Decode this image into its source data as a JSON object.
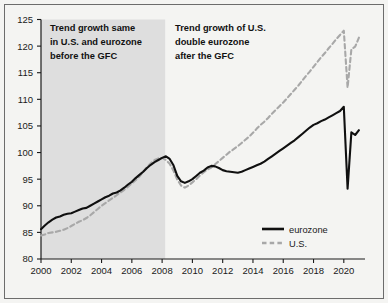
{
  "chart_data": {
    "type": "line",
    "title": "",
    "xlabel": "",
    "ylabel": "",
    "xlim": [
      2000,
      2021.4
    ],
    "ylim": [
      80,
      125
    ],
    "yticks": [
      80,
      85,
      90,
      95,
      100,
      105,
      110,
      115,
      120,
      125
    ],
    "xticks": [
      2000,
      2002,
      2004,
      2006,
      2008,
      2010,
      2012,
      2014,
      2016,
      2018,
      2020
    ],
    "grid": false,
    "legend_position": "bottom-right",
    "shaded_region": {
      "x_start": 2000,
      "x_end": 2008.2,
      "color": "#dedede",
      "label": "pre-GFC period"
    },
    "annotations": [
      {
        "id": "annotation-pre-gfc",
        "lines": [
          "Trend growth same",
          "in U.S. and eurozone",
          "before the GFC"
        ]
      },
      {
        "id": "annotation-post-gfc",
        "lines": [
          "Trend growth of U.S.",
          "double eurozone",
          "after the GFC"
        ]
      }
    ],
    "series": [
      {
        "name": "eurozone",
        "color": "#101010",
        "style": "solid",
        "x": [
          2000.0,
          2000.25,
          2000.5,
          2000.75,
          2001.0,
          2001.25,
          2001.5,
          2001.75,
          2002.0,
          2002.25,
          2002.5,
          2002.75,
          2003.0,
          2003.25,
          2003.5,
          2003.75,
          2004.0,
          2004.25,
          2004.5,
          2004.75,
          2005.0,
          2005.25,
          2005.5,
          2005.75,
          2006.0,
          2006.25,
          2006.5,
          2006.75,
          2007.0,
          2007.25,
          2007.5,
          2007.75,
          2008.0,
          2008.25,
          2008.5,
          2008.75,
          2009.0,
          2009.25,
          2009.5,
          2009.75,
          2010.0,
          2010.25,
          2010.5,
          2010.75,
          2011.0,
          2011.25,
          2011.5,
          2011.75,
          2012.0,
          2012.25,
          2012.5,
          2012.75,
          2013.0,
          2013.25,
          2013.5,
          2013.75,
          2014.0,
          2014.25,
          2014.5,
          2014.75,
          2015.0,
          2015.25,
          2015.5,
          2015.75,
          2016.0,
          2016.25,
          2016.5,
          2016.75,
          2017.0,
          2017.25,
          2017.5,
          2017.75,
          2018.0,
          2018.25,
          2018.5,
          2018.75,
          2019.0,
          2019.25,
          2019.5,
          2019.75,
          2020.0,
          2020.25,
          2020.5,
          2020.75,
          2021.0
        ],
        "values": [
          85.6,
          86.3,
          86.9,
          87.4,
          87.8,
          88.0,
          88.3,
          88.5,
          88.6,
          88.9,
          89.2,
          89.5,
          89.6,
          90.0,
          90.4,
          90.8,
          91.2,
          91.6,
          91.9,
          92.3,
          92.5,
          92.9,
          93.4,
          94.0,
          94.5,
          95.2,
          95.8,
          96.4,
          97.1,
          97.7,
          98.2,
          98.6,
          99.0,
          99.3,
          98.8,
          97.6,
          95.6,
          94.6,
          94.3,
          94.6,
          95.0,
          95.6,
          96.2,
          96.6,
          97.2,
          97.5,
          97.4,
          97.1,
          96.7,
          96.5,
          96.4,
          96.3,
          96.2,
          96.4,
          96.7,
          97.0,
          97.3,
          97.6,
          97.9,
          98.3,
          98.8,
          99.3,
          99.8,
          100.3,
          100.8,
          101.3,
          101.8,
          102.3,
          102.9,
          103.5,
          104.1,
          104.7,
          105.2,
          105.5,
          105.9,
          106.2,
          106.6,
          107.0,
          107.4,
          107.8,
          108.6,
          93.2,
          103.8,
          103.3,
          104.2
        ]
      },
      {
        "name": "U.S.",
        "color": "#a8a8a8",
        "style": "dashed",
        "x": [
          2000.0,
          2000.25,
          2000.5,
          2000.75,
          2001.0,
          2001.25,
          2001.5,
          2001.75,
          2002.0,
          2002.25,
          2002.5,
          2002.75,
          2003.0,
          2003.25,
          2003.5,
          2003.75,
          2004.0,
          2004.25,
          2004.5,
          2004.75,
          2005.0,
          2005.25,
          2005.5,
          2005.75,
          2006.0,
          2006.25,
          2006.5,
          2006.75,
          2007.0,
          2007.25,
          2007.5,
          2007.75,
          2008.0,
          2008.25,
          2008.5,
          2008.75,
          2009.0,
          2009.25,
          2009.5,
          2009.75,
          2010.0,
          2010.25,
          2010.5,
          2010.75,
          2011.0,
          2011.25,
          2011.5,
          2011.75,
          2012.0,
          2012.25,
          2012.5,
          2012.75,
          2013.0,
          2013.25,
          2013.5,
          2013.75,
          2014.0,
          2014.25,
          2014.5,
          2014.75,
          2015.0,
          2015.25,
          2015.5,
          2015.75,
          2016.0,
          2016.25,
          2016.5,
          2016.75,
          2017.0,
          2017.25,
          2017.5,
          2017.75,
          2018.0,
          2018.25,
          2018.5,
          2018.75,
          2019.0,
          2019.25,
          2019.5,
          2019.75,
          2020.0,
          2020.25,
          2020.5,
          2020.75,
          2021.0
        ],
        "values": [
          84.4,
          84.6,
          84.9,
          85.0,
          85.1,
          85.3,
          85.5,
          85.8,
          86.2,
          86.6,
          87.0,
          87.3,
          87.7,
          88.2,
          88.8,
          89.4,
          90.0,
          90.5,
          91.0,
          91.5,
          92.0,
          92.5,
          93.0,
          93.6,
          94.2,
          94.8,
          95.5,
          96.4,
          97.3,
          98.0,
          98.6,
          98.9,
          99.0,
          98.6,
          97.9,
          96.6,
          94.9,
          93.8,
          93.4,
          93.8,
          94.4,
          95.0,
          95.7,
          96.3,
          96.8,
          97.2,
          97.8,
          98.4,
          99.0,
          99.6,
          100.2,
          100.7,
          101.2,
          101.8,
          102.4,
          103.0,
          103.7,
          104.5,
          105.2,
          105.8,
          106.5,
          107.3,
          108.0,
          108.7,
          109.4,
          110.2,
          111.0,
          111.8,
          112.6,
          113.5,
          114.4,
          115.2,
          116.1,
          117.0,
          117.9,
          118.7,
          119.6,
          120.4,
          121.3,
          122.1,
          122.9,
          112.2,
          119.4,
          119.9,
          121.6
        ]
      }
    ]
  },
  "legend": {
    "items": [
      {
        "label": "eurozone",
        "style": "solid",
        "color": "#101010"
      },
      {
        "label": "U.S.",
        "style": "dashed",
        "color": "#a8a8a8"
      }
    ]
  },
  "axes": {
    "y_tick_labels": [
      "80",
      "85",
      "90",
      "95",
      "100",
      "105",
      "110",
      "115",
      "120",
      "125"
    ],
    "x_tick_labels": [
      "2000",
      "2002",
      "2004",
      "2006",
      "2008",
      "2010",
      "2012",
      "2014",
      "2016",
      "2018",
      "2020"
    ]
  },
  "annotations": {
    "pre_gfc": {
      "line1": "Trend growth same",
      "line2": "in U.S. and eurozone",
      "line3": "before the GFC"
    },
    "post_gfc": {
      "line1": "Trend growth of U.S.",
      "line2": "double eurozone",
      "line3": "after the GFC"
    }
  }
}
